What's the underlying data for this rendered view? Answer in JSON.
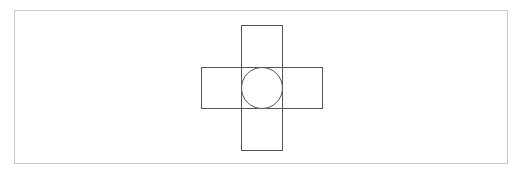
{
  "diagram": {
    "frame": {
      "x": 14.5,
      "y": 10.5,
      "width": 493,
      "height": 153,
      "stroke": "#c8c8c8"
    },
    "shapes": [
      {
        "id": "vertical-rect",
        "type": "rect",
        "x": 241.5,
        "y": 25.5,
        "width": 41,
        "height": 125,
        "stroke": "#555555"
      },
      {
        "id": "horizontal-rect",
        "type": "rect",
        "x": 201.5,
        "y": 67.5,
        "width": 121,
        "height": 41,
        "stroke": "#555555"
      },
      {
        "id": "center-circle",
        "type": "circle",
        "cx": 262,
        "cy": 88,
        "r": 20.5,
        "stroke": "#555555"
      }
    ]
  }
}
